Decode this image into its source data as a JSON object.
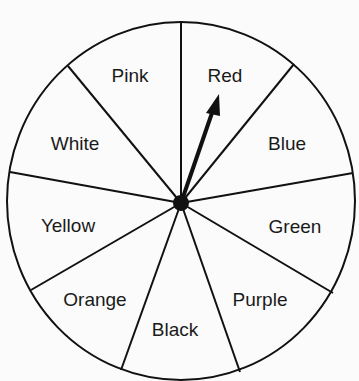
{
  "spinner": {
    "sections": [
      {
        "label": "Pink",
        "x": 130,
        "y": 82
      },
      {
        "label": "Red",
        "x": 225,
        "y": 82
      },
      {
        "label": "Blue",
        "x": 287,
        "y": 150
      },
      {
        "label": "Green",
        "x": 295,
        "y": 233
      },
      {
        "label": "Purple",
        "x": 260,
        "y": 306
      },
      {
        "label": "Black",
        "x": 175,
        "y": 336
      },
      {
        "label": "Orange",
        "x": 95,
        "y": 306
      },
      {
        "label": "Yellow",
        "x": 68,
        "y": 232
      },
      {
        "label": "White",
        "x": 75,
        "y": 150
      }
    ],
    "pointer": {
      "points_to": "Red"
    },
    "colors": {
      "line": "#111111",
      "background": "#fbfbfb"
    }
  }
}
